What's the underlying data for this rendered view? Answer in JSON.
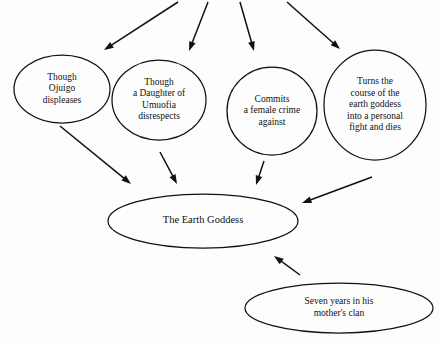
{
  "diagram": {
    "background_color": "#fdfdfd",
    "stroke_color": "#111111",
    "nodes": [
      {
        "id": "ojuigo",
        "shape": "ellipse",
        "cx": 62,
        "cy": 89,
        "rx": 48,
        "ry": 34,
        "font_size": 9.5,
        "line_height": 11.5,
        "lines": [
          "Though",
          "Ojuigo",
          "displeases"
        ]
      },
      {
        "id": "daughter-of-umuofia",
        "shape": "ellipse",
        "cx": 159,
        "cy": 100,
        "rx": 47,
        "ry": 40,
        "font_size": 9.5,
        "line_height": 11.5,
        "lines": [
          "Though",
          "a Daughter of",
          "Umuofia",
          "disrespects"
        ]
      },
      {
        "id": "female-crime",
        "shape": "ellipse",
        "cx": 272,
        "cy": 111,
        "rx": 45,
        "ry": 44,
        "font_size": 9.5,
        "line_height": 11.5,
        "lines": [
          "Commits",
          "a female crime",
          "against"
        ]
      },
      {
        "id": "earth-goddess-course",
        "shape": "ellipse",
        "cx": 375,
        "cy": 105,
        "rx": 51,
        "ry": 55,
        "font_size": 9.5,
        "line_height": 11.5,
        "lines": [
          "Turns the",
          "course of the",
          "earth goddess",
          "into a personal",
          "fight and dies"
        ]
      },
      {
        "id": "the-earth-goddess",
        "shape": "ellipse",
        "cx": 203,
        "cy": 221,
        "rx": 95,
        "ry": 27,
        "font_size": 10.5,
        "line_height": 12,
        "lines": [
          "The Earth Goddess"
        ]
      },
      {
        "id": "seven-years",
        "shape": "ellipse",
        "cx": 339,
        "cy": 308,
        "rx": 94,
        "ry": 25,
        "font_size": 9.5,
        "line_height": 11.5,
        "lines": [
          "Seven years in his",
          "mother's clan"
        ]
      }
    ],
    "edges": [
      {
        "id": "edge-top-to-ojuigo",
        "from": "top-edge",
        "to": "ojuigo",
        "x1": 178,
        "y1": 2,
        "x2": 104,
        "y2": 50
      },
      {
        "id": "edge-top-to-daughter",
        "from": "top-edge",
        "to": "daughter-of-umuofia",
        "x1": 208,
        "y1": 2,
        "x2": 189,
        "y2": 51
      },
      {
        "id": "edge-top-to-female-crime",
        "from": "top-edge",
        "to": "female-crime",
        "x1": 240,
        "y1": 2,
        "x2": 254,
        "y2": 51
      },
      {
        "id": "edge-top-to-course",
        "from": "top-edge",
        "to": "earth-goddess-course",
        "x1": 287,
        "y1": 2,
        "x2": 340,
        "y2": 49
      },
      {
        "id": "edge-ojuigo-to-goddess",
        "from": "ojuigo",
        "to": "the-earth-goddess",
        "x1": 60,
        "y1": 126,
        "x2": 131,
        "y2": 184
      },
      {
        "id": "edge-daughter-to-goddess",
        "from": "daughter-of-umuofia",
        "to": "the-earth-goddess",
        "x1": 160,
        "y1": 152,
        "x2": 177,
        "y2": 184
      },
      {
        "id": "edge-crime-to-goddess",
        "from": "female-crime",
        "to": "the-earth-goddess",
        "x1": 264,
        "y1": 161,
        "x2": 256,
        "y2": 185
      },
      {
        "id": "edge-course-to-goddess",
        "from": "earth-goddess-course",
        "to": "the-earth-goddess",
        "x1": 372,
        "y1": 177,
        "x2": 302,
        "y2": 203
      },
      {
        "id": "edge-seven-years-to-goddess",
        "from": "seven-years",
        "to": "the-earth-goddess",
        "x1": 300,
        "y1": 275,
        "x2": 274,
        "y2": 256
      }
    ]
  }
}
